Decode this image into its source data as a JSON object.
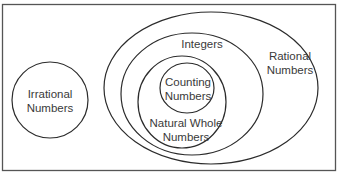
{
  "diagram": {
    "colors": {
      "stroke": "#2b2b2b",
      "border": "#555555",
      "text": "#3a3a3a",
      "background": "#ffffff"
    },
    "sets": {
      "irrational": {
        "line1": "Irrational",
        "line2": "Numbers"
      },
      "rational": {
        "line1": "Rational",
        "line2": "Numbers"
      },
      "integers": {
        "line1": "Integers"
      },
      "natural_whole": {
        "line1": "Natural Whole",
        "line2": "Numbers"
      },
      "counting": {
        "line1": "Counting",
        "line2": "Numbers"
      }
    }
  }
}
